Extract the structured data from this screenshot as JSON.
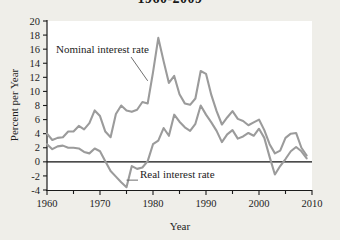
{
  "figure": {
    "title": "1960-2009",
    "background_color": "#efeee9",
    "plot_background_color": "#ffffff"
  },
  "chart_data": {
    "type": "line",
    "title": "1960-2009",
    "xlabel": "Year",
    "ylabel": "Percent per Year",
    "xlim": [
      1960,
      2010
    ],
    "ylim": [
      -4,
      20
    ],
    "xticks": [
      1960,
      1970,
      1980,
      1990,
      2000,
      2010
    ],
    "xtick_labels": [
      "1960",
      "1970",
      "1980",
      "1990",
      "2000",
      "2010"
    ],
    "xminor_ticks": [
      1965,
      1975,
      1985,
      1995,
      2005
    ],
    "yticks": [
      -4,
      -2,
      0,
      2,
      4,
      6,
      8,
      10,
      12,
      14,
      16,
      18,
      20
    ],
    "ytick_labels": [
      "-4",
      "-2",
      "0",
      "2",
      "4",
      "6",
      "8",
      "10",
      "12",
      "14",
      "16",
      "18",
      "20"
    ],
    "grid": false,
    "legend": "none",
    "zero_reference_line": 0,
    "x": [
      1960,
      1961,
      1962,
      1963,
      1964,
      1965,
      1966,
      1967,
      1968,
      1969,
      1970,
      1971,
      1972,
      1973,
      1974,
      1975,
      1976,
      1977,
      1978,
      1979,
      1980,
      1981,
      1982,
      1983,
      1984,
      1985,
      1986,
      1987,
      1988,
      1989,
      1990,
      1991,
      1992,
      1993,
      1994,
      1995,
      1996,
      1997,
      1998,
      1999,
      2000,
      2001,
      2002,
      2003,
      2004,
      2005,
      2006,
      2007,
      2008,
      2009
    ],
    "series": [
      {
        "name": "Nominal interest rate",
        "color": "#9b9b9b",
        "values": [
          4.0,
          3.1,
          3.4,
          3.5,
          4.3,
          4.3,
          5.1,
          4.6,
          5.5,
          7.3,
          6.5,
          4.3,
          3.5,
          6.8,
          8.0,
          7.3,
          7.1,
          7.4,
          8.5,
          8.3,
          12.7,
          17.6,
          14.3,
          11.2,
          12.2,
          9.6,
          8.3,
          8.1,
          9.0,
          12.9,
          12.5,
          9.5,
          7.2,
          5.3,
          6.3,
          7.2,
          6.1,
          5.8,
          5.2,
          5.6,
          6.0,
          4.5,
          2.5,
          1.2,
          1.6,
          3.4,
          4.0,
          4.1,
          2.0,
          0.9
        ]
      },
      {
        "name": "Real interest rate",
        "color": "#9b9b9b",
        "values": [
          2.5,
          1.8,
          2.2,
          2.3,
          2.0,
          2.0,
          1.9,
          1.4,
          1.2,
          1.9,
          1.5,
          0.1,
          -1.3,
          -2.1,
          -2.9,
          -3.6,
          -0.6,
          -1.0,
          -0.8,
          0.1,
          2.5,
          3.0,
          4.8,
          3.7,
          6.7,
          5.7,
          4.9,
          4.4,
          5.4,
          8.0,
          6.7,
          5.6,
          4.4,
          2.8,
          3.9,
          4.5,
          3.3,
          3.6,
          4.1,
          3.7,
          4.7,
          3.4,
          0.7,
          -1.8,
          -0.6,
          0.4,
          1.5,
          2.1,
          1.5,
          0.5
        ]
      }
    ],
    "annotations": [
      {
        "text": "Nominal interest rate",
        "points_to_year": 1979,
        "points_to_value": 11.5
      },
      {
        "text": "Real interest rate",
        "points_to_year": 1975,
        "points_to_value": -2.6
      }
    ]
  }
}
